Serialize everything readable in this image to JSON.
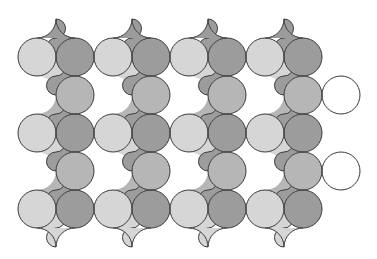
{
  "pattern": {
    "type": "tessellation",
    "description": "Grayscale tiling of interlocking S-curved comma-shaped pieces",
    "grid": {
      "origin_x": 37,
      "origin_y": 57,
      "spacing": 38,
      "radius": 19,
      "columns": 9,
      "rows": 5
    },
    "colors": {
      "light": "#d6d6d6",
      "medium": "#b6b6b6",
      "dark": "#9c9c9c",
      "white": "#ffffff",
      "stroke": "#3a3a3a",
      "background": "#ffffff"
    },
    "circles": [
      [
        "L",
        "D",
        "L",
        "D",
        "L",
        "D",
        "L",
        "D",
        "-"
      ],
      [
        "W",
        "M",
        "W",
        "M",
        "W",
        "M",
        "W",
        "M",
        "W"
      ],
      [
        "L",
        "D",
        "L",
        "D",
        "L",
        "D",
        "L",
        "D",
        "-"
      ],
      [
        "W",
        "M",
        "W",
        "M",
        "W",
        "M",
        "W",
        "M",
        "W"
      ],
      [
        "L",
        "D",
        "L",
        "D",
        "L",
        "D",
        "L",
        "D",
        "-"
      ]
    ],
    "top_cusps": [
      56,
      132,
      208,
      284
    ],
    "bottom_cusps": [
      56,
      132,
      208,
      284
    ]
  }
}
